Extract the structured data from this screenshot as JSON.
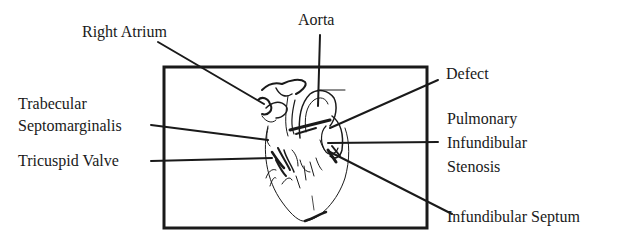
{
  "diagram": {
    "type": "anatomical-label-diagram",
    "colors": {
      "ink": "#1a1a1a",
      "background": "#ffffff"
    },
    "labels": {
      "right_atrium": {
        "text": "Right Atrium"
      },
      "aorta": {
        "text": "Aorta"
      },
      "defect": {
        "text": "Defect"
      },
      "trabecular_septomarginalis": {
        "lines": [
          "Trabecular",
          "Septomarginalis"
        ]
      },
      "tricuspid_valve": {
        "text": "Tricuspid Valve"
      },
      "pulmonary_infundibular_stenosis": {
        "lines": [
          "Pulmonary",
          "Infundibular",
          "Stenosis"
        ]
      },
      "infundibular_septum": {
        "text": "Infundibular Septum"
      }
    }
  }
}
